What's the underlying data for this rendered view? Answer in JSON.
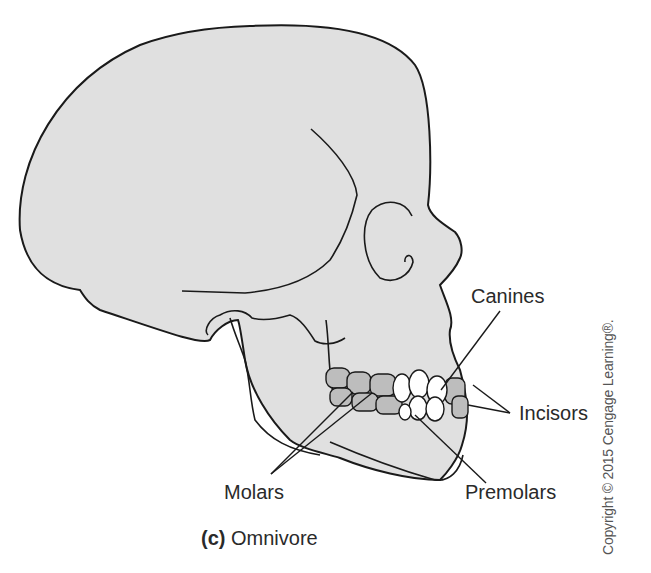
{
  "figure": {
    "caption_letter": "(c)",
    "caption_text": "Omnivore",
    "labels": {
      "canines": "Canines",
      "incisors": "Incisors",
      "molars": "Molars",
      "premolars": "Premolars"
    },
    "copyright": "Copyright © 2015 Cengage Learning®.",
    "colors": {
      "skull_fill": "#e0e0e0",
      "outline": "#1a1a1a",
      "molar_fill": "#bdbdbd",
      "front_teeth_fill": "#ffffff"
    }
  }
}
